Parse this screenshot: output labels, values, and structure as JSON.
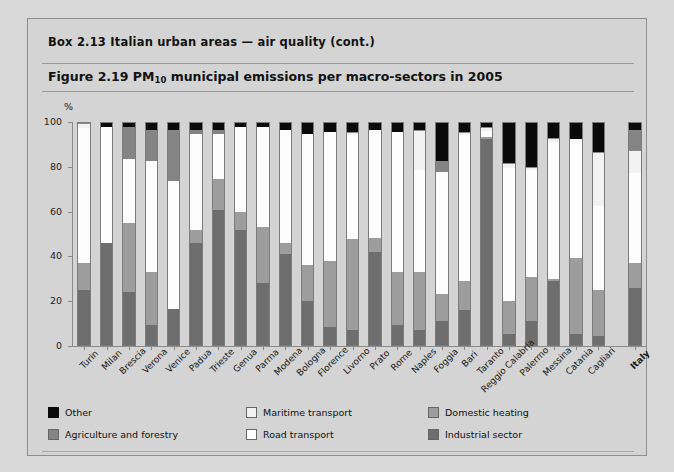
{
  "box": {
    "title": "Box 2.13    Italian urban areas — air quality (cont.)"
  },
  "figure": {
    "number": "Figure 2.19",
    "title_pre": "Figure 2.19  PM",
    "title_sub": "10",
    "title_post": " municipal emissions per macro-sectors in 2005",
    "y_unit": "%"
  },
  "legend": {
    "items": [
      {
        "key": "other",
        "label": "Other",
        "color": "#0a0a0a"
      },
      {
        "key": "maritime",
        "label": "Maritime transport",
        "color": "#f2f2f2"
      },
      {
        "key": "heating",
        "label": "Domestic heating",
        "color": "#9d9d9d"
      },
      {
        "key": "agri",
        "label": "Agriculture and forestry",
        "color": "#848484"
      },
      {
        "key": "road",
        "label": "Road transport",
        "color": "#fdfdfd"
      },
      {
        "key": "industrial",
        "label": "Industrial sector",
        "color": "#6e6e6e"
      }
    ]
  },
  "chart_data": {
    "type": "bar",
    "subtype": "stacked-100-percent",
    "title": "Figure 2.19 PM10 municipal emissions per macro-sectors in 2005",
    "xlabel": "",
    "ylabel": "%",
    "ylim": [
      0,
      100
    ],
    "yticks": [
      0,
      20,
      40,
      60,
      80,
      100
    ],
    "grid": false,
    "legend_position": "bottom",
    "categories": [
      "Turin",
      "Milan",
      "Brescia",
      "Verona",
      "Venice",
      "Padua",
      "Trieste",
      "Genua",
      "Parma",
      "Modena",
      "Bologna",
      "Florence",
      "Livorno",
      "Prato",
      "Rome",
      "Naples",
      "Foggia",
      "Bari",
      "Taranto",
      "Reggio Calabria",
      "Palermo",
      "Messina",
      "Catania",
      "Cagliari",
      "Italy"
    ],
    "series": [
      {
        "name": "Industrial sector",
        "color": "#6e6e6e",
        "values": [
          25,
          46,
          24,
          9,
          16,
          46,
          61,
          52,
          28,
          41,
          20,
          8,
          7,
          42,
          9,
          7,
          11,
          16,
          93,
          5,
          11,
          29,
          5,
          4,
          26
        ]
      },
      {
        "name": "Domestic heating",
        "color": "#9d9d9d",
        "values": [
          12,
          0,
          31,
          24,
          0,
          6,
          14,
          8,
          25,
          5,
          16,
          30,
          41,
          6,
          24,
          26,
          12,
          13,
          1,
          15,
          20,
          1,
          34,
          21,
          11
        ]
      },
      {
        "name": "Road transport",
        "color": "#fdfdfd",
        "values": [
          61,
          52,
          29,
          50,
          58,
          43,
          20,
          38,
          45,
          51,
          59,
          58,
          47,
          49,
          63,
          46,
          55,
          66,
          3,
          60,
          48,
          62,
          54,
          38,
          41
        ]
      },
      {
        "name": "Maritime transport",
        "color": "#f2f2f2",
        "values": [
          2,
          0,
          0,
          0,
          0,
          0,
          0,
          0,
          0,
          0,
          0,
          0,
          1,
          0,
          0,
          18,
          0,
          1,
          1,
          2,
          1,
          1,
          0,
          24,
          10
        ]
      },
      {
        "name": "Agriculture and forestry",
        "color": "#848484",
        "values": [
          0,
          0,
          14,
          14,
          23,
          2,
          2,
          0,
          0,
          0,
          0,
          0,
          0,
          0,
          0,
          0,
          5,
          0,
          0,
          0,
          0,
          0,
          0,
          0,
          9
        ]
      },
      {
        "name": "Other",
        "color": "#0a0a0a",
        "values": [
          0,
          2,
          2,
          3,
          3,
          3,
          3,
          2,
          2,
          3,
          5,
          4,
          4,
          3,
          4,
          3,
          17,
          4,
          2,
          18,
          20,
          7,
          7,
          13,
          3
        ]
      }
    ]
  }
}
